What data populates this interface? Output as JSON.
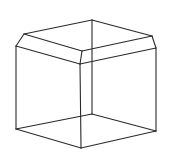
{
  "figure": {
    "stroke_color": "#2a2a2a",
    "stroke_width": 1.1,
    "background": "#ffffff",
    "vertices": {
      "top_back": [
        92,
        20
      ],
      "top_left": [
        24,
        34
      ],
      "top_front": [
        82,
        51
      ],
      "top_right": [
        152,
        36
      ],
      "chamfer_left": [
        16,
        46
      ],
      "chamfer_front": [
        80,
        64
      ],
      "chamfer_right": [
        156,
        48
      ],
      "bottom_left": [
        16,
        129
      ],
      "bottom_front": [
        81,
        148
      ],
      "bottom_right": [
        156,
        131
      ],
      "bottom_back": [
        92,
        114
      ]
    },
    "edges": [
      {
        "name": "top-back-left",
        "from": "top_back",
        "to": "top_left"
      },
      {
        "name": "top-back-right",
        "from": "top_back",
        "to": "top_right"
      },
      {
        "name": "top-left-front",
        "from": "top_left",
        "to": "top_front"
      },
      {
        "name": "top-front-right",
        "from": "top_front",
        "to": "top_right"
      },
      {
        "name": "chamfer-left-slant",
        "from": "top_left",
        "to": "chamfer_left"
      },
      {
        "name": "chamfer-front-slant",
        "from": "top_front",
        "to": "chamfer_front"
      },
      {
        "name": "chamfer-right-slant",
        "from": "top_right",
        "to": "chamfer_right"
      },
      {
        "name": "chamfer-left-front",
        "from": "chamfer_left",
        "to": "chamfer_front"
      },
      {
        "name": "chamfer-front-right",
        "from": "chamfer_front",
        "to": "chamfer_right"
      },
      {
        "name": "vertical-left",
        "from": "chamfer_left",
        "to": "bottom_left"
      },
      {
        "name": "vertical-front",
        "from": "chamfer_front",
        "to": "bottom_front"
      },
      {
        "name": "vertical-right",
        "from": "chamfer_right",
        "to": "bottom_right"
      },
      {
        "name": "vertical-back",
        "from": "top_back",
        "to": "bottom_back"
      },
      {
        "name": "bottom-left-front",
        "from": "bottom_left",
        "to": "bottom_front"
      },
      {
        "name": "bottom-front-right",
        "from": "bottom_front",
        "to": "bottom_right"
      },
      {
        "name": "bottom-back-left",
        "from": "bottom_back",
        "to": "bottom_left"
      },
      {
        "name": "bottom-back-right",
        "from": "bottom_back",
        "to": "bottom_right"
      }
    ]
  }
}
